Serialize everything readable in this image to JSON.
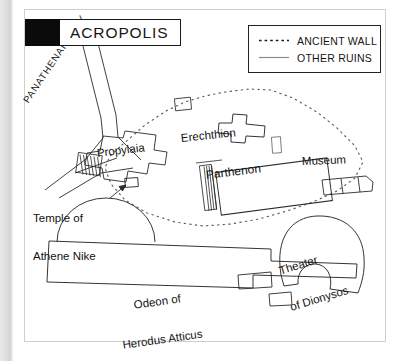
{
  "page": {
    "background_color": "#ffffff",
    "frame_border_color": "#cfcfd1",
    "ink_color": "#131313"
  },
  "title": {
    "text": "ACROPOLIS",
    "swatch_color": "#0b0b0b"
  },
  "legend": {
    "items": [
      {
        "label": "ANCIENT WALL",
        "style": "dotted",
        "icon": "dotted-line-icon"
      },
      {
        "label": "OTHER RUINS",
        "style": "solid",
        "icon": "solid-line-icon"
      }
    ]
  },
  "map": {
    "labels": {
      "panathenaic_way": "PANATHENAIC WAY",
      "propylaia": "Propylaia",
      "erechthion": "Erechthion",
      "parthenon": "Parthenon",
      "museum": "Museum",
      "athene_nike_line1": "Temple of",
      "athene_nike_line2": "Athene Nike",
      "odeon_line1": "Odeon of",
      "odeon_line2": "Herodus Atticus",
      "theater_line1": "Theater",
      "theater_line2": "of Dionysos"
    }
  }
}
